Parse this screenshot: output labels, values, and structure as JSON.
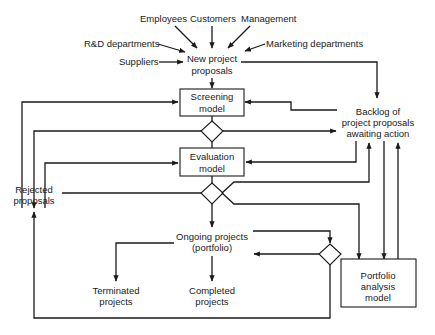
{
  "diagram": {
    "type": "flowchart",
    "colors": {
      "line": "#1a1a1a",
      "background": "#ffffff"
    },
    "sources": {
      "employees": "Employees",
      "customers": "Customers",
      "management": "Management",
      "rd": "R&D departments",
      "marketing": "Marketing departments",
      "suppliers": "Suppliers"
    },
    "new_proposals": {
      "line1": "New project",
      "line2": "proposals"
    },
    "screening": {
      "line1": "Screening",
      "line2": "model"
    },
    "evaluation": {
      "line1": "Evaluation",
      "line2": "model"
    },
    "backlog": {
      "line1": "Backlog of",
      "line2": "project proposals",
      "line3": "awaiting action"
    },
    "rejected": {
      "line1": "Rejected",
      "line2": "proposals"
    },
    "ongoing": {
      "line1": "Ongoing projects",
      "line2": "(portfolio)"
    },
    "portfolio_model": {
      "line1": "Portfolio",
      "line2": "analysis",
      "line3": "model"
    },
    "terminated": {
      "line1": "Terminated",
      "line2": "projects"
    },
    "completed": {
      "line1": "Completed",
      "line2": "projects"
    }
  }
}
